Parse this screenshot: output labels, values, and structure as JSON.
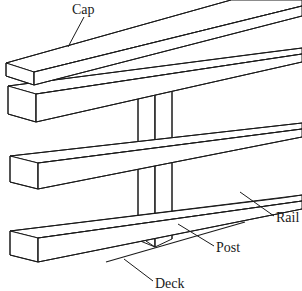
{
  "diagram": {
    "style": {
      "line_color": "#1a1a1a",
      "fill_color": "#ffffff",
      "background": "#ffffff",
      "line_width": 1
    },
    "labels": [
      {
        "id": "cap",
        "text": "Cap",
        "x": 72,
        "y": 12,
        "leader": "M 84 17 L 68 47"
      },
      {
        "id": "rail",
        "text": "Rail",
        "x": 276,
        "y": 222,
        "leader": "M 274 216 L 240 192"
      },
      {
        "id": "post",
        "text": "Post",
        "x": 216,
        "y": 251,
        "leader": "M 214 246 L 178 224"
      },
      {
        "id": "deck",
        "text": "Deck",
        "x": 155,
        "y": 287,
        "leader": "M 153 281 L 124 259"
      }
    ],
    "parts": {
      "cap": {
        "name": "Cap",
        "top_face": "M 7 66 L 232 0 L 302 0 L 302 0 L 302 0 L 248 16 L 7 66 Z",
        "description": "Top horizontal cap board, isometric, extends off upper right"
      },
      "top_rail": {
        "name": "Top rail",
        "description": "Upper rail board under the cap"
      },
      "middle_rail": {
        "name": "Middle rail",
        "description": "Center rail board"
      },
      "bottom_rail": {
        "name": "Bottom rail",
        "description": "Lower rail board resting above the deck"
      },
      "post": {
        "name": "Post",
        "description": "Vertical post passing behind all three rails down to the deck"
      },
      "deck": {
        "name": "Deck",
        "description": "Deck surface line at the base of the post"
      }
    }
  }
}
